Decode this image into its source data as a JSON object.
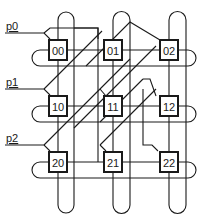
{
  "diagram": {
    "type": "3x3 torus mesh with processor inputs",
    "inputs": [
      {
        "label": "p0",
        "row": 0
      },
      {
        "label": "p1",
        "row": 1
      },
      {
        "label": "p2",
        "row": 2
      }
    ],
    "nodes": [
      {
        "label": "00",
        "row": 0,
        "col": 0
      },
      {
        "label": "01",
        "row": 0,
        "col": 1
      },
      {
        "label": "02",
        "row": 0,
        "col": 2
      },
      {
        "label": "10",
        "row": 1,
        "col": 0
      },
      {
        "label": "11",
        "row": 1,
        "col": 1
      },
      {
        "label": "12",
        "row": 1,
        "col": 2
      },
      {
        "label": "20",
        "row": 2,
        "col": 0
      },
      {
        "label": "21",
        "row": 2,
        "col": 1
      },
      {
        "label": "22",
        "row": 2,
        "col": 2
      }
    ],
    "colors": {
      "line": "#1a1a1a",
      "background": "#ffffff"
    }
  }
}
